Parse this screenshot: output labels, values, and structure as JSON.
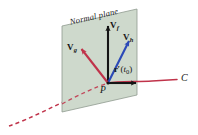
{
  "figure": {
    "name": "normal-plane-vector-diagram",
    "width": 198,
    "height": 135,
    "background": "#ffffff"
  },
  "plane": {
    "label": "Normal plane",
    "fill": "#ced9cc",
    "stroke": "#8f9a8f",
    "corners": [
      [
        62,
        26
      ],
      [
        137,
        9
      ],
      [
        137,
        95
      ],
      [
        62,
        112
      ]
    ]
  },
  "point": {
    "label": "P",
    "x": 108,
    "y": 83,
    "color": "#151515"
  },
  "curve": {
    "label": "C",
    "color": "#c0334a",
    "dashed_segment": "behind plane",
    "solid_segment": "in front of plane"
  },
  "vectors": [
    {
      "name": "v-f",
      "symbol": "V",
      "subscript": "f",
      "color": "#141414",
      "from": [
        108,
        83
      ],
      "to": [
        108,
        25
      ],
      "label_x": 110,
      "label_y": 22
    },
    {
      "name": "v-h",
      "symbol": "V",
      "subscript": "h",
      "color": "#2b49b8",
      "from": [
        108,
        83
      ],
      "to": [
        130,
        39
      ],
      "label_x": 123,
      "label_y": 35
    },
    {
      "name": "v-g",
      "symbol": "V",
      "subscript": "g",
      "color": "#c0334a",
      "from": [
        108,
        83
      ],
      "to": [
        80,
        47
      ],
      "label_x": 67,
      "label_y": 44
    }
  ],
  "tangent": {
    "name": "r-prime-t0",
    "text_r": "r",
    "text_prime": "′",
    "text_open": "(",
    "text_t": "t",
    "text_sub": "0",
    "text_close": ")",
    "color": "#141414",
    "from": [
      108,
      83
    ],
    "to": [
      138,
      83
    ],
    "label_x": 114,
    "label_y": 66
  },
  "colors": {
    "black": "#141414",
    "blue": "#2b49b8",
    "red": "#c0334a",
    "plane_fill": "#ced9cc",
    "plane_stroke": "#8f9a8f"
  }
}
